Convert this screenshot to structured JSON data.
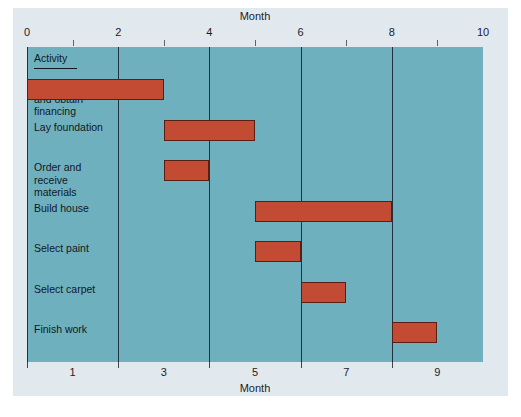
{
  "chart_data": {
    "type": "bar",
    "subtype": "gantt",
    "title": "Month",
    "xlabel": "Month",
    "ylabel": "Activity",
    "top_axis_title": "Month",
    "bottom_axis_title": "Month",
    "activity_header": "Activity",
    "xlim": [
      0,
      10
    ],
    "grid": true,
    "legend": "none",
    "top_tick_labels": [
      "0",
      "2",
      "4",
      "6",
      "8",
      "10"
    ],
    "top_tick_values": [
      0,
      2,
      4,
      6,
      8,
      10
    ],
    "bottom_tick_labels": [
      "1",
      "3",
      "5",
      "7",
      "9"
    ],
    "bottom_tick_values": [
      1,
      3,
      5,
      7,
      9
    ],
    "gridline_values": [
      0,
      2,
      4,
      6,
      8
    ],
    "categories": [
      "Design house and obtain financing",
      "Lay foundation",
      "Order and receive materials",
      "Build house",
      "Select paint",
      "Select carpet",
      "Finish work"
    ],
    "tasks": [
      {
        "label": "Design house\nand obtain\nfinancing",
        "start": 0,
        "end": 3,
        "duration": 3
      },
      {
        "label": "Lay foundation",
        "start": 3,
        "end": 5,
        "duration": 2
      },
      {
        "label": "Order and\nreceive\nmaterials",
        "start": 3,
        "end": 4,
        "duration": 1
      },
      {
        "label": "Build house",
        "start": 5,
        "end": 8,
        "duration": 3
      },
      {
        "label": "Select paint",
        "start": 5,
        "end": 6,
        "duration": 1
      },
      {
        "label": "Select carpet",
        "start": 6,
        "end": 7,
        "duration": 1
      },
      {
        "label": "Finish work",
        "start": 8,
        "end": 9,
        "duration": 1
      }
    ],
    "colors": {
      "bar": "#c34a33",
      "bar_border": "#5a1f14",
      "plot_background": "#6fb0bf",
      "panel_background": "#e2e9ee",
      "gridline": "#223040",
      "text": "#101824",
      "page_background": "#ffffff"
    }
  }
}
